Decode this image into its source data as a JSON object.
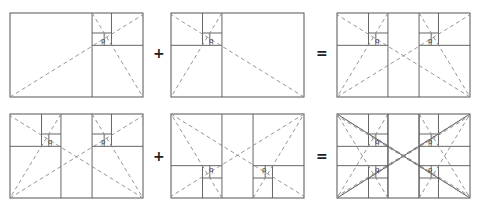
{
  "figure": {
    "stroke_color": "#555555",
    "dash_color": "#8a8a8a",
    "background": "#ffffff"
  },
  "operators": [
    {
      "symbol": "+",
      "x": 153,
      "y": 46
    },
    {
      "symbol": "=",
      "x": 316,
      "y": 46
    },
    {
      "symbol": "+",
      "x": 153,
      "y": 149
    },
    {
      "symbol": "=",
      "x": 316,
      "y": 149
    }
  ],
  "panels": [
    {
      "id": "top-left",
      "x": 10,
      "y": 13,
      "w": 133,
      "h": 84,
      "variants": [
        {
          "flipX": false,
          "flipY": false
        }
      ],
      "label": "p"
    },
    {
      "id": "top-middle",
      "x": 171,
      "y": 13,
      "w": 133,
      "h": 84,
      "variants": [
        {
          "flipX": true,
          "flipY": false
        }
      ],
      "label": "q"
    },
    {
      "id": "top-right",
      "x": 337,
      "y": 13,
      "w": 133,
      "h": 84,
      "variants": [
        {
          "flipX": false,
          "flipY": false
        },
        {
          "flipX": true,
          "flipY": false
        }
      ],
      "label": "p+q"
    },
    {
      "id": "bottom-left",
      "x": 10,
      "y": 114,
      "w": 133,
      "h": 84,
      "variants": [
        {
          "flipX": false,
          "flipY": false
        },
        {
          "flipX": true,
          "flipY": false
        }
      ],
      "label": "p+q"
    },
    {
      "id": "bottom-middle",
      "x": 171,
      "y": 114,
      "w": 133,
      "h": 84,
      "variants": [
        {
          "flipX": false,
          "flipY": true
        },
        {
          "flipX": true,
          "flipY": true
        }
      ],
      "label": "p+q flipped"
    },
    {
      "id": "bottom-right",
      "x": 337,
      "y": 114,
      "w": 133,
      "h": 84,
      "variants": [
        {
          "flipX": false,
          "flipY": false
        },
        {
          "flipX": true,
          "flipY": false
        },
        {
          "flipX": false,
          "flipY": true
        },
        {
          "flipX": true,
          "flipY": true
        }
      ],
      "full_diagonals": true,
      "label": "all"
    }
  ],
  "labels": {
    "p": "p",
    "q": "q"
  }
}
